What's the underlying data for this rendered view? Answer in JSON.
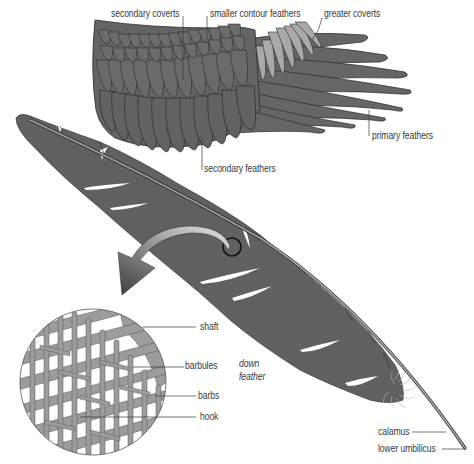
{
  "colors": {
    "feather_dark": "#5f5f5f",
    "feather_mid": "#6e6e6e",
    "greater_coverts": "#a8a8a8",
    "outline": "#2b2b2b",
    "shaft": "#9a9a9a",
    "microscope_fill": "#9c9c9c",
    "label_text": "#3a3a3a",
    "background": "#ffffff"
  },
  "wing": {
    "labels": {
      "secondary_coverts": "secondary coverts",
      "smaller_contour_feathers": "smaller contour feathers",
      "greater_coverts": "greater coverts",
      "primary_feathers": "primary feathers",
      "secondary_feathers": "secondary feathers"
    }
  },
  "magnified_view": {
    "labels": {
      "shaft": "shaft",
      "barbules": "barbules",
      "barbs": "barbs",
      "hook": "hook"
    }
  },
  "feather": {
    "labels": {
      "down_feather_line1": "down",
      "down_feather_line2": "feather",
      "calamus": "calamus",
      "lower_umbilicus": "lower umbilicus"
    }
  }
}
